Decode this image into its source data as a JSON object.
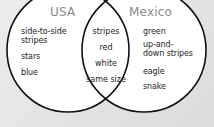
{
  "diagram": {
    "type": "venn",
    "left": {
      "title": "USA",
      "items": [
        "side-to-side",
        "stripes",
        "stars",
        "blue"
      ]
    },
    "right": {
      "title": "Mexico",
      "items": [
        "green",
        "up-and-",
        "down stripes",
        "eagle",
        "snake"
      ]
    },
    "overlap": {
      "items": [
        "stripes",
        "red",
        "white",
        "same size"
      ]
    },
    "colors": {
      "background": "#e4e4e4",
      "circle_fill": "#ffffff",
      "circle_stroke": "#111111",
      "title_text": "#8a8a8a",
      "body_text": "#1e1e1e"
    }
  }
}
